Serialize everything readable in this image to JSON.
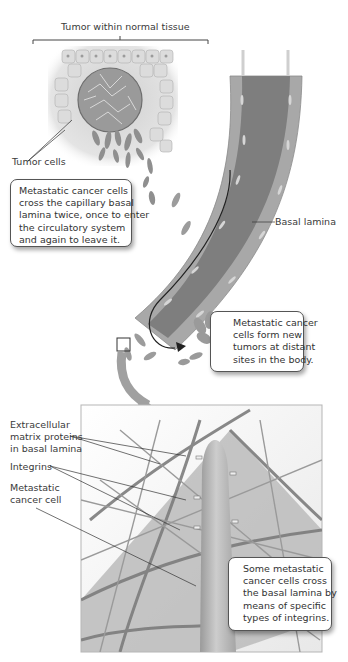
{
  "figure": {
    "top_cropped_title_fragment": "",
    "labels": {
      "tumor_region": "Tumor within normal tissue",
      "tumor_cells": "Tumor cells",
      "basal_lamina": "Basal lamina",
      "ecm_proteins": [
        "Extracellular",
        "matrix proteins",
        "in basal lamina"
      ],
      "integrins": "Integrins",
      "metastatic_cell": [
        "Metastatic",
        "cancer cell"
      ]
    },
    "callouts": {
      "cross_twice": [
        "Metastatic cancer cells",
        "cross the capillary basal",
        "lamina twice, once to enter",
        "the circulatory system",
        "and again to leave it."
      ],
      "new_tumors": [
        "Metastatic cancer",
        "cells form new",
        "tumors at distant",
        "sites in the body."
      ],
      "integrin_crossing": [
        "Some metastatic",
        "cancer cells cross",
        "the basal lamina by",
        "means of specific",
        "types of integrins."
      ]
    },
    "colors": {
      "vessel_wall": "#a9a9a9",
      "vessel_lumen": "#7f7f7f",
      "tumor_cell": "#8c8c8c",
      "normal_cell": "#d9d9d9",
      "arrow": "#9a9a9a",
      "frame": "#b5b5b5"
    }
  }
}
